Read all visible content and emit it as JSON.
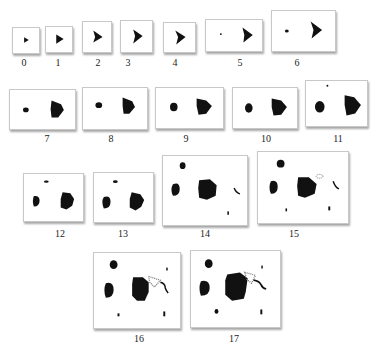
{
  "figure": {
    "colors": {
      "blob": "#111111",
      "hatched": "#777777",
      "panel_bg": "#ffffff",
      "border": "#c8c8c8"
    },
    "panels": [
      {
        "label": "0",
        "x": 12,
        "y": 27,
        "w": 28,
        "h": 27
      },
      {
        "label": "1",
        "x": 45,
        "y": 26,
        "w": 28,
        "h": 27
      },
      {
        "label": "2",
        "x": 82,
        "y": 21,
        "w": 30,
        "h": 32
      },
      {
        "label": "3",
        "x": 120,
        "y": 20,
        "w": 33,
        "h": 33
      },
      {
        "label": "4",
        "x": 163,
        "y": 22,
        "w": 33,
        "h": 31
      },
      {
        "label": "5",
        "x": 205,
        "y": 19,
        "w": 58,
        "h": 33
      },
      {
        "label": "6",
        "x": 271,
        "y": 10,
        "w": 65,
        "h": 42
      },
      {
        "label": "7",
        "x": 9,
        "y": 89,
        "w": 67,
        "h": 41
      },
      {
        "label": "8",
        "x": 82,
        "y": 87,
        "w": 66,
        "h": 43
      },
      {
        "label": "9",
        "x": 155,
        "y": 87,
        "w": 69,
        "h": 42
      },
      {
        "label": "10",
        "x": 232,
        "y": 87,
        "w": 66,
        "h": 42
      },
      {
        "label": "11",
        "x": 305,
        "y": 80,
        "w": 63,
        "h": 47
      },
      {
        "label": "12",
        "x": 23,
        "y": 173,
        "w": 61,
        "h": 49
      },
      {
        "label": "13",
        "x": 93,
        "y": 172,
        "w": 61,
        "h": 51
      },
      {
        "label": "14",
        "x": 162,
        "y": 155,
        "w": 86,
        "h": 71
      },
      {
        "label": "15",
        "x": 257,
        "y": 151,
        "w": 92,
        "h": 73
      },
      {
        "label": "16",
        "x": 93,
        "y": 252,
        "w": 88,
        "h": 77
      },
      {
        "label": "17",
        "x": 190,
        "y": 250,
        "w": 91,
        "h": 78
      }
    ]
  }
}
